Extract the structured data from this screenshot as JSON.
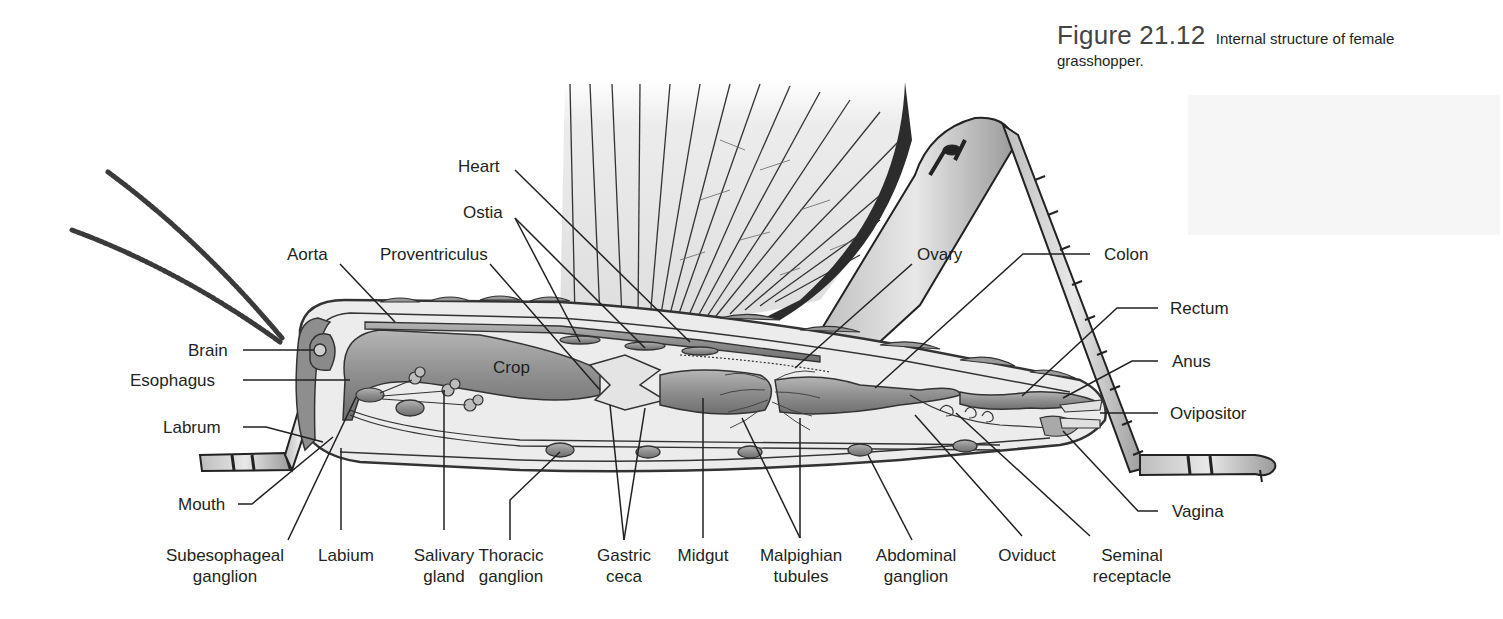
{
  "figure": {
    "number": "Figure 21.12",
    "caption_line1": "Internal structure of female",
    "caption_line2": "grasshopper."
  },
  "diagram": {
    "crop_label": "Crop",
    "labels_top": {
      "heart": "Heart",
      "ostia": "Ostia",
      "aorta": "Aorta",
      "proventriculus": "Proventriculus",
      "ovary": "Ovary",
      "colon": "Colon"
    },
    "labels_left": {
      "brain": "Brain",
      "esophagus": "Esophagus",
      "labrum": "Labrum",
      "mouth": "Mouth"
    },
    "labels_right": {
      "rectum": "Rectum",
      "anus": "Anus",
      "ovipositor": "Ovipositor",
      "vagina": "Vagina"
    },
    "labels_bottom": {
      "subesophageal_1": "Subesophageal",
      "subesophageal_2": "ganglion",
      "labium": "Labium",
      "salivary_1": "Salivary",
      "salivary_2": "gland",
      "thoracic_1": "Thoracic",
      "thoracic_2": "ganglion",
      "gastric_1": "Gastric",
      "gastric_2": "ceca",
      "midgut": "Midgut",
      "malpighian_1": "Malpighian",
      "malpighian_2": "tubules",
      "abdominal_1": "Abdominal",
      "abdominal_2": "ganglion",
      "oviduct": "Oviduct",
      "seminal_1": "Seminal",
      "seminal_2": "receptacle"
    }
  },
  "colors": {
    "ink": "#231f20",
    "organ_fill": "#9a9a9a",
    "organ_light": "#cfcfcf",
    "body_fill": "#e6e6e6",
    "wing_fill": "#e9e9e9",
    "leader_line": "#231f20"
  }
}
